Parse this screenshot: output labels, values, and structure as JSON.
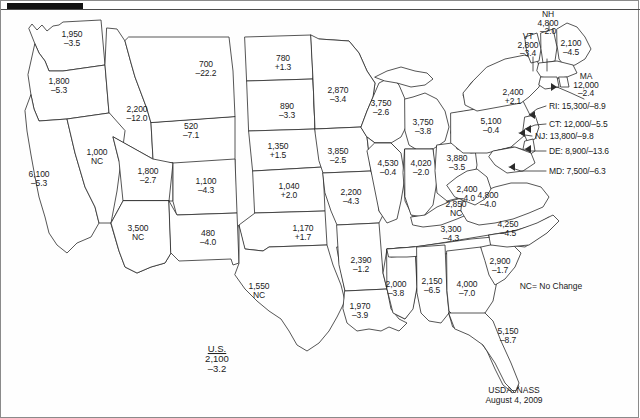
{
  "figure": {
    "source_agency": "USDA–NASS",
    "source_date": "August 4, 2009",
    "legend_note": "NC= No Change",
    "us_total": {
      "title": "U.S.",
      "value": "2,100",
      "change": "–3.2"
    }
  },
  "chart_data": {
    "type": "map",
    "title": "U.S.",
    "subtitle": "USDA–NASS  August 4, 2009",
    "legend": [
      "NC= No Change"
    ],
    "value_label": "value",
    "change_label": "percent change",
    "us_total": {
      "value": 2100,
      "change": -3.2
    },
    "states": [
      {
        "code": "WA",
        "name": "Washington",
        "value": "1,950",
        "change": "–3.5",
        "x": 71,
        "y": 38
      },
      {
        "code": "OR",
        "name": "Oregon",
        "value": "1,800",
        "change": "–5.3",
        "x": 58,
        "y": 85
      },
      {
        "code": "CA",
        "name": "California",
        "value": "6,100",
        "change": "–5.3",
        "x": 38,
        "y": 178
      },
      {
        "code": "ID",
        "name": "Idaho",
        "value": "2,200",
        "change": "–12.0",
        "x": 136,
        "y": 113
      },
      {
        "code": "NV",
        "name": "Nevada",
        "value": "1,000",
        "change": "NC",
        "x": 96,
        "y": 156
      },
      {
        "code": "MT",
        "name": "Montana",
        "value": "700",
        "change": "–22.2",
        "x": 205,
        "y": 68
      },
      {
        "code": "WY",
        "name": "Wyoming",
        "value": "520",
        "change": "–7.1",
        "x": 190,
        "y": 130
      },
      {
        "code": "UT",
        "name": "Utah",
        "value": "1,800",
        "change": "–2.7",
        "x": 147,
        "y": 175
      },
      {
        "code": "CO",
        "name": "Colorado",
        "value": "1,100",
        "change": "–4.3",
        "x": 205,
        "y": 185
      },
      {
        "code": "AZ",
        "name": "Arizona",
        "value": "3,500",
        "change": "NC",
        "x": 137,
        "y": 232
      },
      {
        "code": "NM",
        "name": "New Mexico",
        "value": "480",
        "change": "–4.0",
        "x": 207,
        "y": 237
      },
      {
        "code": "ND",
        "name": "North Dakota",
        "value": "780",
        "change": "+1.3",
        "x": 282,
        "y": 62
      },
      {
        "code": "SD",
        "name": "South Dakota",
        "value": "890",
        "change": "–3.3",
        "x": 286,
        "y": 110
      },
      {
        "code": "NE",
        "name": "Nebraska",
        "value": "1,350",
        "change": "+1.5",
        "x": 277,
        "y": 150
      },
      {
        "code": "KS",
        "name": "Kansas",
        "value": "1,040",
        "change": "+2.0",
        "x": 288,
        "y": 190
      },
      {
        "code": "OK",
        "name": "Oklahoma",
        "value": "1,170",
        "change": "+1.7",
        "x": 302,
        "y": 232
      },
      {
        "code": "TX",
        "name": "Texas",
        "value": "1,550",
        "change": "NC",
        "x": 258,
        "y": 290
      },
      {
        "code": "MN",
        "name": "Minnesota",
        "value": "2,870",
        "change": "–3.4",
        "x": 337,
        "y": 94
      },
      {
        "code": "IA",
        "name": "Iowa",
        "value": "3,850",
        "change": "–2.5",
        "x": 337,
        "y": 155
      },
      {
        "code": "MO",
        "name": "Missouri",
        "value": "2,200",
        "change": "–4.3",
        "x": 350,
        "y": 196
      },
      {
        "code": "AR",
        "name": "Arkansas",
        "value": "2,390",
        "change": "–1.2",
        "x": 360,
        "y": 264
      },
      {
        "code": "LA",
        "name": "Louisiana",
        "value": "1,970",
        "change": "–3.9",
        "x": 359,
        "y": 310
      },
      {
        "code": "MS",
        "name": "Mississippi",
        "value": "2,000",
        "change": "–3.8",
        "x": 395,
        "y": 288
      },
      {
        "code": "WI",
        "name": "Wisconsin",
        "value": "3,750",
        "change": "–2.6",
        "x": 380,
        "y": 107
      },
      {
        "code": "MI",
        "name": "Michigan",
        "value": "3,750",
        "change": "–3.8",
        "x": 422,
        "y": 126
      },
      {
        "code": "IL",
        "name": "Illinois",
        "value": "4,530",
        "change": "–0.4",
        "x": 387,
        "y": 167
      },
      {
        "code": "IN",
        "name": "Indiana",
        "value": "4,020",
        "change": "–2.0",
        "x": 420,
        "y": 167
      },
      {
        "code": "OH",
        "name": "Ohio",
        "value": "3,880",
        "change": "–3.5",
        "x": 456,
        "y": 162
      },
      {
        "code": "KY",
        "name": "Kentucky",
        "value": "2,850",
        "change": "NC",
        "x": 455,
        "y": 208
      },
      {
        "code": "TN",
        "name": "Tennessee",
        "value": "3,300",
        "change": "–4.3",
        "x": 450,
        "y": 233
      },
      {
        "code": "AL",
        "name": "Alabama",
        "value": "2,150",
        "change": "–6.5",
        "x": 431,
        "y": 285
      },
      {
        "code": "GA",
        "name": "Georgia",
        "value": "4,000",
        "change": "–7.0",
        "x": 466,
        "y": 288
      },
      {
        "code": "FL",
        "name": "Florida",
        "value": "5,150",
        "change": "–8.7",
        "x": 507,
        "y": 335
      },
      {
        "code": "SC",
        "name": "South Carolina",
        "value": "2,900",
        "change": "–1.7",
        "x": 499,
        "y": 265
      },
      {
        "code": "NC",
        "name": "North Carolina",
        "value": "4,250",
        "change": "–4.5",
        "x": 507,
        "y": 228
      },
      {
        "code": "VA",
        "name": "Virginia",
        "value": "4,800",
        "change": "–4.0",
        "x": 487,
        "y": 199
      },
      {
        "code": "WV",
        "name": "West Virginia",
        "value": "2,400",
        "change": "–4.0",
        "x": 466,
        "y": 193
      },
      {
        "code": "PA",
        "name": "Pennsylvania",
        "value": "5,100",
        "change": "–0.4",
        "x": 490,
        "y": 125
      },
      {
        "code": "NY",
        "name": "New York",
        "value": "2,400",
        "change": "+2.1",
        "x": 512,
        "y": 96
      },
      {
        "code": "VT",
        "name": "Vermont",
        "value": "2,800",
        "change": "–3.4",
        "x": 527,
        "y": 44,
        "abbr": "VT",
        "abbr_inline": true
      },
      {
        "code": "NH",
        "name": "New Hampshire",
        "value": "4,800",
        "change": "–2.0",
        "x": 547,
        "y": 22,
        "abbr": "NH"
      },
      {
        "code": "ME",
        "name": "Maine",
        "value": "2,100",
        "change": "–4.5",
        "x": 570,
        "y": 47
      },
      {
        "code": "MA",
        "name": "Massachusetts",
        "value": "12,000",
        "change": "–2.4",
        "x": 585,
        "y": 84,
        "abbr": "MA"
      }
    ],
    "callouts": [
      {
        "code": "RI",
        "name": "Rhode Island",
        "text": "RI: 15,300/–8.9",
        "x": 548,
        "y": 105
      },
      {
        "code": "CT",
        "name": "Connecticut",
        "text": "CT: 12,000/–5.5",
        "x": 548,
        "y": 123
      },
      {
        "code": "NJ",
        "name": "New Jersey",
        "text": "NJ: 13,800/–9.8",
        "x": 534,
        "y": 135
      },
      {
        "code": "DE",
        "name": "Delaware",
        "text": "DE: 8,900/–13.6",
        "x": 548,
        "y": 150
      },
      {
        "code": "MD",
        "name": "Maryland",
        "text": "MD: 7,500/–6.3",
        "x": 548,
        "y": 170
      }
    ]
  }
}
